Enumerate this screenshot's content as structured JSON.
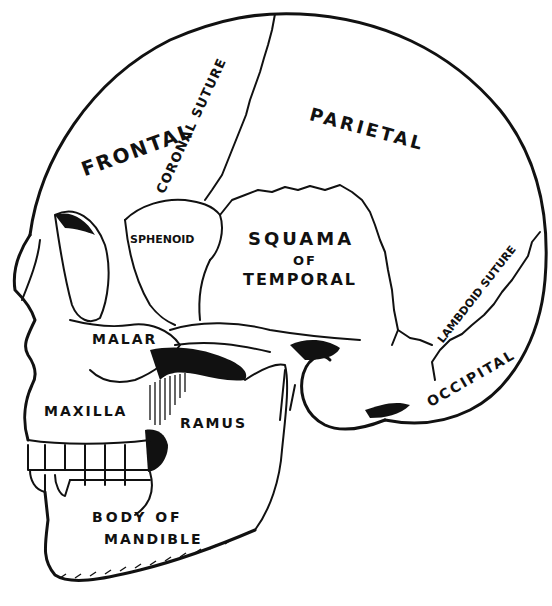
{
  "diagram": {
    "colors": {
      "ink": "#111111",
      "background": "#ffffff"
    },
    "labels": {
      "frontal": "FRONTAL",
      "coronal_suture": "CORONAL SUTURE",
      "parietal": "PARIETAL",
      "sphenoid": "SPHENOID",
      "squama_line1": "SQUAMA",
      "squama_line2": "OF",
      "squama_line3": "TEMPORAL",
      "lambdoid_suture": "LAMBDOID SUTURE",
      "malar": "MALAR",
      "occipital": "OCCIPITAL",
      "maxilla": "MAXILLA",
      "ramus": "RAMUS",
      "body_line1": "BODY OF",
      "body_line2": "MANDIBLE"
    }
  }
}
